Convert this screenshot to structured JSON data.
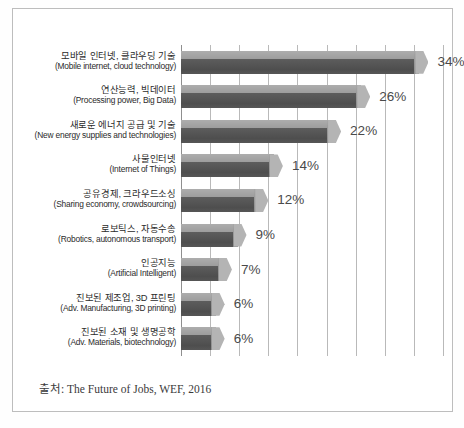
{
  "chart_data": {
    "type": "bar",
    "orientation": "horizontal",
    "title": "",
    "xlabel": "",
    "ylabel": "",
    "xlim": [
      0,
      36
    ],
    "grid": true,
    "gridline_step": 4,
    "legend": "none",
    "value_suffix": "%",
    "categories": [
      "모바일 인터넷, 클라우딩 기술 (Mobile internet, cloud technology)",
      "연산능력, 빅데이터 (Processing power, Big Data)",
      "새로운 에너지 공급 및 기술 (New energy supplies and technologies)",
      "사물인터넷 (Internet of Things)",
      "공유경제, 크라우드소싱 (Sharing economy, crowdsourcing)",
      "로보틱스, 자동수송 (Robotics, autonomous transport)",
      "인공지능 (Artificial Intelligent)",
      "진보된 제조업, 3D 프린팅 (Adv. Manufacturing, 3D printing)",
      "진보된 소재 및 생명공학 (Adv. Materials, biotechnology)"
    ],
    "values": [
      34,
      26,
      22,
      14,
      12,
      9,
      7,
      6,
      6
    ],
    "bars": [
      {
        "ko": "모바일 인터넷, 클라우딩 기술",
        "en": "(Mobile internet, cloud technology)",
        "value": 34,
        "label": "34%"
      },
      {
        "ko": "연산능력, 빅데이터",
        "en": "(Processing power, Big Data)",
        "value": 26,
        "label": "26%"
      },
      {
        "ko": "새로운 에너지 공급 및 기술",
        "en": "(New energy supplies and technologies)",
        "value": 22,
        "label": "22%"
      },
      {
        "ko": "사물인터넷",
        "en": "(Internet of Things)",
        "value": 14,
        "label": "14%"
      },
      {
        "ko": "공유경제, 크라우드소싱",
        "en": "(Sharing economy, crowdsourcing)",
        "value": 12,
        "label": "12%"
      },
      {
        "ko": "로보틱스, 자동수송",
        "en": "(Robotics, autonomous transport)",
        "value": 9,
        "label": "9%"
      },
      {
        "ko": "인공지능",
        "en": "(Artificial Intelligent)",
        "value": 7,
        "label": "7%"
      },
      {
        "ko": "진보된 제조업, 3D 프린팅",
        "en": "(Adv. Manufacturing, 3D printing)",
        "value": 6,
        "label": "6%"
      },
      {
        "ko": "진보된 소재 및 생명공학",
        "en": "(Adv. Materials, biotechnology)",
        "value": 6,
        "label": "6%"
      }
    ],
    "colors": {
      "bar_top": "#a5a5a5",
      "bar_body": "#525252",
      "bar_cap": "#b4b4b4",
      "gridline": "#b9b9b9",
      "axis": "#8f8f8f",
      "value_text": "#4a4a4a",
      "label_text": "#2b2b2b",
      "frame": "#bdbdbd",
      "background": "#ffffff"
    }
  },
  "source": {
    "text": "출처: The Future of Jobs, WEF, 2016"
  }
}
